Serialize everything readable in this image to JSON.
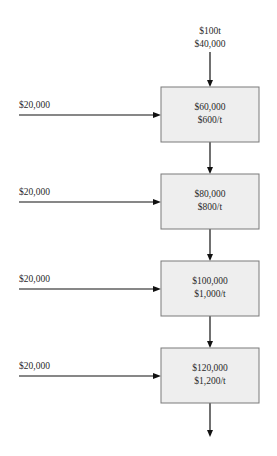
{
  "diagram": {
    "type": "flow-chain",
    "initial_input": {
      "lines": [
        "$100t",
        "$40,000"
      ]
    },
    "side_inputs": [
      {
        "label": "$20,000"
      },
      {
        "label": "$20,000"
      },
      {
        "label": "$20,000"
      },
      {
        "label": "$20,000"
      }
    ],
    "stages": [
      {
        "lines": [
          "$60,000",
          "$600/t"
        ]
      },
      {
        "lines": [
          "$80,000",
          "$800/t"
        ]
      },
      {
        "lines": [
          "$100,000",
          "$1,000/t"
        ]
      },
      {
        "lines": [
          "$120,000",
          "$1,200/t"
        ]
      }
    ],
    "colors": {
      "box_fill": "#eeeeee",
      "box_border": "#7a7a7a",
      "arrow": "#111111"
    }
  }
}
